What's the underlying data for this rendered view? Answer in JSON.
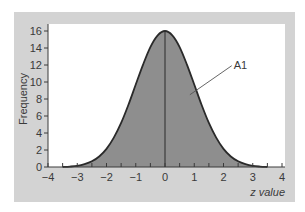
{
  "chart_data": {
    "type": "area",
    "title": "",
    "xlabel": "z value",
    "ylabel": "Frequency",
    "xlim": [
      -4,
      4
    ],
    "ylim": [
      0,
      16
    ],
    "xticks": [
      -4,
      -3,
      -2,
      -1,
      0,
      1,
      2,
      3,
      4
    ],
    "xtick_labels": [
      "−4",
      "−3",
      "−2",
      "−1",
      "0",
      "1",
      "2",
      "3",
      "4"
    ],
    "yticks": [
      0,
      2,
      4,
      6,
      8,
      10,
      12,
      14,
      16
    ],
    "ytick_labels": [
      "0",
      "2",
      "4",
      "6",
      "8",
      "10",
      "12",
      "14",
      "16"
    ],
    "minor_xtick_step": 0.5,
    "grid": false,
    "legend": null,
    "series": [
      {
        "name": "Normal distribution curve",
        "x": [
          -3.5,
          -3.25,
          -3,
          -2.75,
          -2.5,
          -2.25,
          -2,
          -1.75,
          -1.5,
          -1.25,
          -1,
          -0.75,
          -0.5,
          -0.25,
          0,
          0.25,
          0.5,
          0.75,
          1,
          1.25,
          1.5,
          1.75,
          2,
          2.25,
          2.5,
          2.75,
          3,
          3.25,
          3.5
        ],
        "values": [
          0,
          0.05,
          0.14,
          0.34,
          0.67,
          1.24,
          2.13,
          3.45,
          5.18,
          7.32,
          9.7,
          12.05,
          14.11,
          15.49,
          16,
          15.49,
          14.11,
          12.05,
          9.7,
          7.32,
          5.18,
          3.45,
          2.13,
          1.24,
          0.67,
          0.34,
          0.14,
          0.05,
          0
        ]
      }
    ],
    "annotations": [
      {
        "text": "A1",
        "x": 2.35,
        "y": 11.8,
        "points_to": {
          "x": 0.85,
          "y": 8.5
        }
      }
    ],
    "reference_lines": [
      {
        "type": "vertical",
        "x": 0
      }
    ],
    "colors": {
      "fill": "#8e8e8e",
      "curve": "#2a2a2a",
      "panel": "#d3d3d3",
      "plot_bg": "#ffffff",
      "axis": "#3a3a3a"
    }
  },
  "labels": {
    "xlabel": "z value",
    "ylabel": "Frequency",
    "annotation": "A1"
  }
}
